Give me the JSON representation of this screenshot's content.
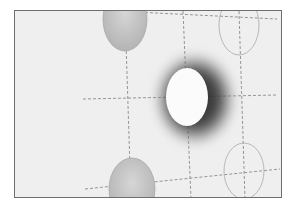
{
  "image": {
    "kind": "grayscale photograph",
    "subject": "grid of ellipses with dashed guide lines; central white ellipse surrounded by a dark halo",
    "colors": {
      "background": "#efefef",
      "frame": "#6e6e6e",
      "halo": "#3a3a3a",
      "center_ellipse": "#fbfbfb",
      "shaded_ellipse": "#c8c8c8",
      "outline_ellipse": "#b0b0b0",
      "dash": "#8a8a8a"
    },
    "ellipses": [
      {
        "id": "top-left",
        "cx": 110,
        "cy": 8,
        "rx": 22,
        "ry": 32,
        "style": "shaded"
      },
      {
        "id": "center",
        "cx": 172,
        "cy": 86,
        "rx": 21,
        "ry": 29,
        "style": "bright-with-halo"
      },
      {
        "id": "top-right",
        "cx": 224,
        "cy": 14,
        "rx": 20,
        "ry": 30,
        "style": "outline"
      },
      {
        "id": "bottom-left",
        "cx": 117,
        "cy": 178,
        "rx": 23,
        "ry": 31,
        "style": "shaded"
      },
      {
        "id": "bottom-right",
        "cx": 229,
        "cy": 160,
        "rx": 20,
        "ry": 28,
        "style": "outline"
      }
    ]
  }
}
